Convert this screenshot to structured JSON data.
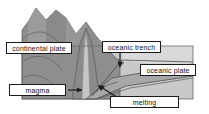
{
  "figure": {
    "palette": {
      "background": "#ffffff",
      "crust_dark": "#8e8e8e",
      "crust_mid": "#a3a3a3",
      "mantle_light": "#c9c9c9",
      "ocean_light": "#d6d6d6",
      "magma_conduit": "#c2c2c2",
      "outline": "#3a3a3a",
      "label_border": "#1a1a1a",
      "label_fill": "#ffffff",
      "label_text": "#121212",
      "arrow": "#1a1a1a"
    }
  },
  "labels": {
    "continental_plate": "continental plate",
    "oceanic_trench": "oceanic trench",
    "oceanic_plate": "oceanic plate",
    "magma": "magma",
    "melting": "melting"
  },
  "arrows": [
    {
      "name": "magma-arrow",
      "direction": "right"
    },
    {
      "name": "oceanic-trench-arrow",
      "direction": "down"
    },
    {
      "name": "melting-arrow",
      "direction": "up-left"
    }
  ]
}
